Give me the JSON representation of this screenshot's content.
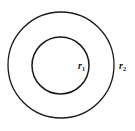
{
  "figure": {
    "background_color": "#ffffff",
    "stroke_color": "#1a1a1a",
    "width": 135,
    "height": 131
  },
  "chart_data": {
    "type": "diagram",
    "subtype": "concentric-circles",
    "title": "",
    "xlabel": "",
    "ylabel": "",
    "grid": false,
    "legend": false,
    "center": {
      "x": 61,
      "y": 65
    },
    "shapes": [
      {
        "name": "outer-circle",
        "kind": "circle",
        "cx": 61,
        "cy": 65,
        "r": 53,
        "stroke": "#1a1a1a",
        "stroke_width": 1.3,
        "fill": "none"
      },
      {
        "name": "inner-circle",
        "kind": "circle",
        "cx": 60.5,
        "cy": 65.5,
        "r": 28.5,
        "stroke": "#1a1a1a",
        "stroke_width": 1.5,
        "fill": "none"
      }
    ],
    "annotations": [
      {
        "name": "inner-radius-label",
        "base": "r",
        "subscript": "1",
        "text": "r1",
        "x": 78,
        "y": 69,
        "font_size": 10,
        "describes": "inner-circle"
      },
      {
        "name": "outer-radius-label",
        "base": "r",
        "subscript": "2",
        "text": "r2",
        "x": 119,
        "y": 69,
        "font_size": 10,
        "describes": "outer-circle"
      }
    ]
  },
  "labels": {
    "inner": {
      "base": "r",
      "sub": "1"
    },
    "outer": {
      "base": "r",
      "sub": "2"
    }
  }
}
